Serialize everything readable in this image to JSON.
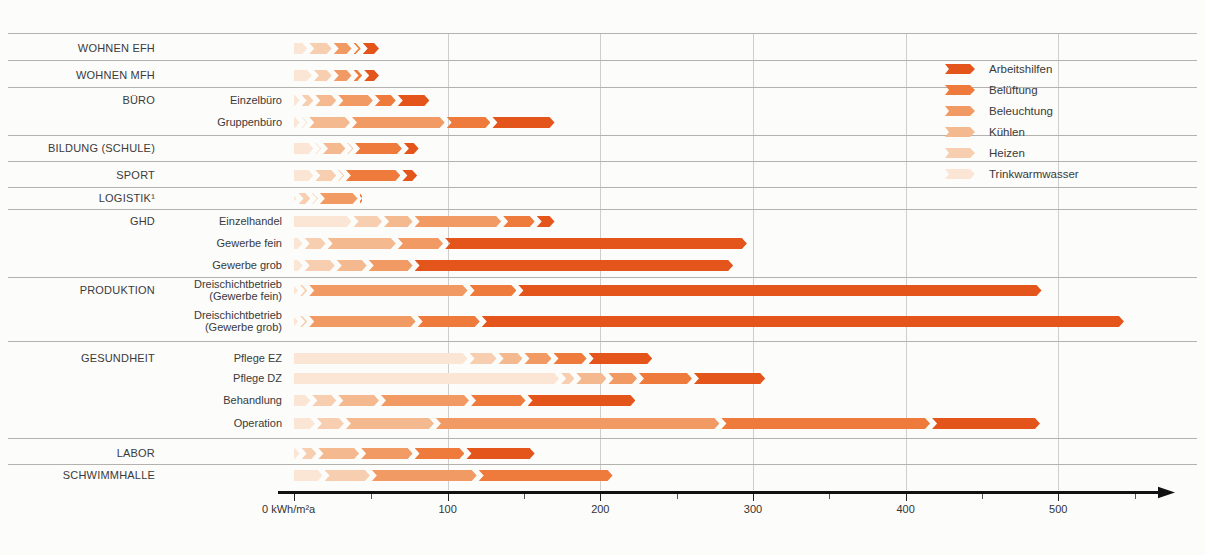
{
  "chart_data": {
    "type": "bar",
    "orientation": "horizontal",
    "stacked": true,
    "unit": "kWh/m²a",
    "origin_label": "0 kWh/m²a",
    "x_ticks": [
      100,
      200,
      300,
      400,
      500
    ],
    "x_minor_ticks": [
      50,
      150,
      250,
      350,
      450,
      550
    ],
    "xlim": [
      0,
      575
    ],
    "grid": "vertical-major",
    "legend_position": "top-right",
    "segment_order": [
      "trinkwarmwasser",
      "heizen",
      "kuehlen",
      "beleuchtung",
      "belueftung",
      "arbeitshilfen"
    ],
    "legend": [
      {
        "key": "arbeitshilfen",
        "label": "Arbeitshilfen",
        "color": "#e4551c"
      },
      {
        "key": "belueftung",
        "label": "Belüftung",
        "color": "#ee7b3c"
      },
      {
        "key": "beleuchtung",
        "label": "Beleuchtung",
        "color": "#f29a64"
      },
      {
        "key": "kuehlen",
        "label": "Kühlen",
        "color": "#f5b98f"
      },
      {
        "key": "heizen",
        "label": "Heizen",
        "color": "#f8ceb1"
      },
      {
        "key": "trinkwarmwasser",
        "label": "Trinkwarmwasser",
        "color": "#fbe6d5"
      }
    ],
    "rows": [
      {
        "group": "WOHNEN EFH",
        "sub": "",
        "values": {
          "trinkwarmwasser": 10,
          "heizen": 16,
          "kuehlen": 0,
          "beleuchtung": 13,
          "belueftung": 6,
          "arbeitshilfen": 12
        },
        "total": 57
      },
      {
        "group": "WOHNEN MFH",
        "sub": "",
        "values": {
          "trinkwarmwasser": 13,
          "heizen": 13,
          "kuehlen": 0,
          "beleuchtung": 13,
          "belueftung": 7,
          "arbeitshilfen": 11
        },
        "total": 57
      },
      {
        "group": "BÜRO",
        "sub": "Einzelbüro",
        "values": {
          "trinkwarmwasser": 5,
          "heizen": 9,
          "kuehlen": 15,
          "beleuchtung": 24,
          "belueftung": 15,
          "arbeitshilfen": 22
        },
        "total": 90
      },
      {
        "group": "",
        "sub": "Gruppenbüro",
        "values": {
          "trinkwarmwasser": 5,
          "heizen": 5,
          "kuehlen": 28,
          "beleuchtung": 62,
          "belueftung": 30,
          "arbeitshilfen": 42
        },
        "total": 172
      },
      {
        "group": "BILDUNG (SCHULE)",
        "sub": "",
        "values": {
          "trinkwarmwasser": 14,
          "heizen": 5,
          "kuehlen": 16,
          "beleuchtung": 5,
          "belueftung": 32,
          "arbeitshilfen": 11
        },
        "total": 83
      },
      {
        "group": "SPORT",
        "sub": "",
        "values": {
          "trinkwarmwasser": 14,
          "heizen": 15,
          "kuehlen": 0,
          "beleuchtung": 5,
          "belueftung": 37,
          "arbeitshilfen": 11
        },
        "total": 82
      },
      {
        "group": "LOGISTIK¹",
        "sub": "",
        "values": {
          "trinkwarmwasser": 2,
          "heizen": 9,
          "kuehlen": 5,
          "beleuchtung": 26,
          "belueftung": 3,
          "arbeitshilfen": 0
        },
        "total": 45
      },
      {
        "group": "GHD",
        "sub": "Einzelhandel",
        "values": {
          "trinkwarmwasser": 39,
          "heizen": 20,
          "kuehlen": 20,
          "beleuchtung": 58,
          "belueftung": 22,
          "arbeitshilfen": 13
        },
        "total": 172
      },
      {
        "group": "",
        "sub": "Gewerbe fein",
        "values": {
          "trinkwarmwasser": 7,
          "heizen": 15,
          "kuehlen": 46,
          "beleuchtung": 31,
          "belueftung": 0,
          "arbeitshilfen": 199
        },
        "total": 298
      },
      {
        "group": "",
        "sub": "Gewerbe grob",
        "values": {
          "trinkwarmwasser": 7,
          "heizen": 21,
          "kuehlen": 21,
          "beleuchtung": 30,
          "belueftung": 0,
          "arbeitshilfen": 210
        },
        "total": 289
      },
      {
        "group": "PRODUKTION",
        "sub": "Dreischichtbetrieb\n(Gewerbe fein)",
        "values": {
          "trinkwarmwasser": 4,
          "heizen": 6,
          "kuehlen": 0,
          "beleuchtung": 105,
          "belueftung": 32,
          "arbeitshilfen": 344
        },
        "total": 491
      },
      {
        "group": "",
        "sub": "Dreischichtbetrieb\n(Gewerbe grob)",
        "values": {
          "trinkwarmwasser": 4,
          "heizen": 6,
          "kuehlen": 0,
          "beleuchtung": 71,
          "belueftung": 42,
          "arbeitshilfen": 422
        },
        "total": 545
      },
      {
        "group": "GESUNDHEIT",
        "sub": "Pflege EZ",
        "values": {
          "trinkwarmwasser": 115,
          "heizen": 19,
          "kuehlen": 17,
          "beleuchtung": 19,
          "belueftung": 23,
          "arbeitshilfen": 43
        },
        "total": 236
      },
      {
        "group": "",
        "sub": "Pflege DZ",
        "values": {
          "trinkwarmwasser": 175,
          "heizen": 10,
          "kuehlen": 21,
          "beleuchtung": 20,
          "belueftung": 36,
          "arbeitshilfen": 48
        },
        "total": 310
      },
      {
        "group": "",
        "sub": "Behandlung",
        "values": {
          "trinkwarmwasser": 12,
          "heizen": 17,
          "kuehlen": 28,
          "beleuchtung": 59,
          "belueftung": 37,
          "arbeitshilfen": 72
        },
        "total": 225
      },
      {
        "group": "",
        "sub": "Operation",
        "values": {
          "trinkwarmwasser": 15,
          "heizen": 19,
          "kuehlen": 59,
          "beleuchtung": 187,
          "belueftung": 138,
          "arbeitshilfen": 72
        },
        "total": 490
      },
      {
        "group": "LABOR",
        "sub": "",
        "values": {
          "trinkwarmwasser": 5,
          "heizen": 11,
          "kuehlen": 28,
          "beleuchtung": 35,
          "belueftung": 34,
          "arbeitshilfen": 46
        },
        "total": 159
      },
      {
        "group": "SCHWIMMHALLE",
        "sub": "",
        "values": {
          "trinkwarmwasser": 20,
          "heizen": 31,
          "kuehlen": 0,
          "beleuchtung": 70,
          "belueftung": 89,
          "arbeitshilfen": 0
        },
        "total": 210
      }
    ]
  }
}
